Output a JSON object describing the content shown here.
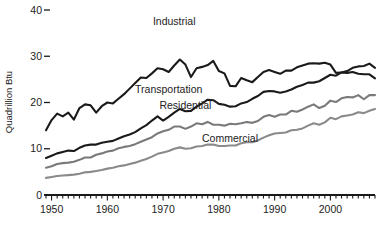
{
  "chart_data": {
    "type": "line",
    "title": "",
    "xlabel": "",
    "ylabel": "Quadrillion Btu",
    "xlim": [
      1949,
      2008
    ],
    "ylim": [
      0,
      40
    ],
    "grid": false,
    "legend_position": "inline-annotations",
    "x_tick_labels": [
      "1950",
      "1960",
      "1970",
      "1980",
      "1990",
      "2000"
    ],
    "x_tick_values": [
      1950,
      1960,
      1970,
      1980,
      1990,
      2000
    ],
    "x_minor_tick_interval": 1,
    "y_tick_labels": [
      "0",
      "10",
      "20",
      "30",
      "40"
    ],
    "y_tick_values": [
      0,
      10,
      20,
      30,
      40
    ],
    "x": [
      1949,
      1950,
      1951,
      1952,
      1953,
      1954,
      1955,
      1956,
      1957,
      1958,
      1959,
      1960,
      1961,
      1962,
      1963,
      1964,
      1965,
      1966,
      1967,
      1968,
      1969,
      1970,
      1971,
      1972,
      1973,
      1974,
      1975,
      1976,
      1977,
      1978,
      1979,
      1980,
      1981,
      1982,
      1983,
      1984,
      1985,
      1986,
      1987,
      1988,
      1989,
      1990,
      1991,
      1992,
      1993,
      1994,
      1995,
      1996,
      1997,
      1998,
      1999,
      2000,
      2001,
      2002,
      2003,
      2004,
      2005,
      2006,
      2007,
      2008
    ],
    "series": [
      {
        "name": "Industrial",
        "color": "#1a1a1a",
        "label_x": 1972,
        "label_y": 36.8,
        "values": [
          14.0,
          16.2,
          17.6,
          17.0,
          17.8,
          16.3,
          18.8,
          19.6,
          19.4,
          17.8,
          19.2,
          20.0,
          19.8,
          20.8,
          21.8,
          23.0,
          24.2,
          25.4,
          25.3,
          26.3,
          27.4,
          27.2,
          26.6,
          28.0,
          29.3,
          28.2,
          25.5,
          27.4,
          27.7,
          28.1,
          29.0,
          26.8,
          26.3,
          23.6,
          23.5,
          25.3,
          24.8,
          24.4,
          25.5,
          26.6,
          27.0,
          26.6,
          26.2,
          26.9,
          26.9,
          27.6,
          28.0,
          28.4,
          28.5,
          28.4,
          28.6,
          28.2,
          26.4,
          26.5,
          26.4,
          26.6,
          26.2,
          26.1,
          26.1,
          25.2
        ]
      },
      {
        "name": "Transportation",
        "color": "#1a1a1a",
        "label_x": 1971,
        "label_y": 22.0,
        "values": [
          8.0,
          8.5,
          9.0,
          9.3,
          9.6,
          9.5,
          10.2,
          10.7,
          10.9,
          10.9,
          11.3,
          11.5,
          11.7,
          12.2,
          12.7,
          13.1,
          13.6,
          14.4,
          15.1,
          16.1,
          17.0,
          16.1,
          16.9,
          17.8,
          18.6,
          18.1,
          18.2,
          19.1,
          19.8,
          20.6,
          20.5,
          19.7,
          19.5,
          19.1,
          19.2,
          19.8,
          20.1,
          20.8,
          21.4,
          22.3,
          22.5,
          22.4,
          22.1,
          22.4,
          22.8,
          23.4,
          23.8,
          24.3,
          24.3,
          24.6,
          25.3,
          26.0,
          25.8,
          26.5,
          26.8,
          27.5,
          27.8,
          27.9,
          28.4,
          27.5
        ]
      },
      {
        "name": "Residential",
        "color": "#7a7a7a",
        "label_x": 1974,
        "label_y": 18.5,
        "values": [
          5.9,
          6.2,
          6.7,
          6.9,
          7.0,
          7.2,
          7.6,
          8.1,
          8.1,
          8.7,
          9.0,
          9.4,
          9.6,
          10.1,
          10.4,
          10.6,
          11.0,
          11.5,
          12.0,
          12.5,
          13.3,
          13.8,
          14.1,
          14.8,
          14.8,
          14.3,
          14.8,
          15.5,
          15.3,
          15.8,
          15.2,
          15.2,
          15.0,
          15.4,
          15.3,
          15.5,
          15.8,
          15.6,
          16.0,
          16.9,
          17.3,
          16.9,
          17.4,
          17.4,
          18.2,
          18.0,
          18.5,
          19.1,
          19.6,
          18.8,
          19.3,
          20.4,
          20.1,
          20.9,
          21.2,
          21.1,
          21.6,
          20.7,
          21.6,
          21.6
        ]
      },
      {
        "name": "Commercial",
        "color": "#8a8a8a",
        "label_x": 1982,
        "label_y": 11.4,
        "values": [
          3.7,
          3.9,
          4.1,
          4.2,
          4.3,
          4.4,
          4.6,
          4.9,
          5.0,
          5.2,
          5.4,
          5.7,
          5.9,
          6.2,
          6.4,
          6.7,
          7.0,
          7.4,
          7.8,
          8.3,
          8.9,
          9.2,
          9.5,
          10.0,
          10.3,
          10.0,
          10.1,
          10.5,
          10.6,
          10.9,
          10.9,
          10.6,
          10.6,
          10.7,
          10.7,
          11.2,
          11.4,
          11.4,
          11.8,
          12.4,
          12.9,
          13.3,
          13.4,
          13.5,
          14.0,
          14.1,
          14.4,
          15.0,
          15.5,
          15.2,
          15.7,
          16.7,
          16.4,
          17.0,
          17.2,
          17.4,
          17.9,
          17.7,
          18.2,
          18.6
        ]
      }
    ]
  },
  "axis": {
    "y_label": "Quadrillion Btu"
  }
}
